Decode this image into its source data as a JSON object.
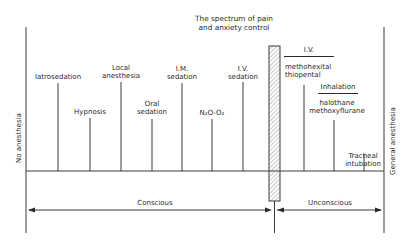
{
  "title": {
    "line1": "The spectrum of pain",
    "line2": "and anxiety control"
  },
  "axis_labels": {
    "left": "No anesthesia",
    "right": "General anesthesia"
  },
  "techniques": [
    {
      "lines": [
        "Iatrosedation"
      ],
      "x": 58
    },
    {
      "lines": [
        "Hypnosis"
      ],
      "x": 90
    },
    {
      "lines": [
        "Local",
        "anesthesia"
      ],
      "x": 121
    },
    {
      "lines": [
        "Oral",
        "sedation"
      ],
      "x": 152
    },
    {
      "lines": [
        "I.M.",
        "sedation"
      ],
      "x": 182
    },
    {
      "lines": [
        "N₂O-O₂"
      ],
      "x": 212
    },
    {
      "lines": [
        "I.V.",
        "sedation"
      ],
      "x": 243
    }
  ],
  "general_techniques": {
    "iv": {
      "heading": "I.V.",
      "agents": [
        "methohexital",
        "thiopental"
      ]
    },
    "inhalation": {
      "heading": "Inhalation",
      "agents": [
        "halothane",
        "methoxyflurane"
      ]
    },
    "tracheal": {
      "lines": [
        "Tracheal",
        "intubation"
      ]
    }
  },
  "states": {
    "conscious": "Conscious",
    "unconscious": "Unconscious"
  },
  "colors": {
    "line": "#3a3a3a",
    "text": "#2a2a2a",
    "background": "#ffffff"
  }
}
